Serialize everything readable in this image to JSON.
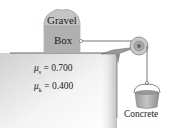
{
  "diagram": {
    "box_top_label": "Gravel",
    "box_label": "Box",
    "hanging_label": "Concrete",
    "coefficients": [
      {
        "symbol": "μ",
        "subscript": "s",
        "equals": "=",
        "value": "0.700"
      },
      {
        "symbol": "μ",
        "subscript": "k",
        "equals": "=",
        "value": "0.400"
      }
    ],
    "colors": {
      "box_fill": "#b8b8b8",
      "table_fill": "#9a9a9a",
      "line": "#555555",
      "bucket": "#a8a8a8"
    }
  }
}
